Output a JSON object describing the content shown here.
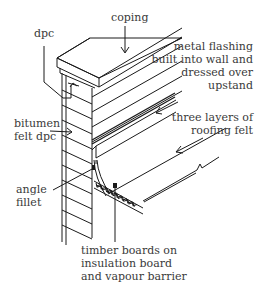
{
  "diagram": {
    "labels": {
      "coping": "coping",
      "dpc": "dpc",
      "metal_flashing": [
        "metal flashing",
        "built into wall and",
        "dressed over",
        "upstand"
      ],
      "bitumen": [
        "bitumen",
        "felt dpc"
      ],
      "three_layers": [
        "three layers of",
        "roofing felt"
      ],
      "angle_fillet": [
        "angle",
        "fillet"
      ],
      "timber_boards": [
        "timber boards on",
        "insulation board",
        "and vapour barrier"
      ]
    },
    "colors": {
      "line": "#1a1a1a",
      "text": "#3a3a3a",
      "background": "#ffffff"
    }
  }
}
